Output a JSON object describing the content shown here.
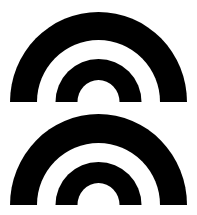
{
  "figures": [
    {
      "name": "top-concentric-semicircles",
      "center_x": 98.5,
      "baseline_y": 102,
      "bands": [
        {
          "rx": 88.5,
          "ry": 90,
          "color": "#000000"
        },
        {
          "rx": 61.5,
          "ry": 62,
          "color": "#ffffff"
        },
        {
          "rx": 43,
          "ry": 43,
          "color": "#000000"
        },
        {
          "rx": 21,
          "ry": 22,
          "color": "#ffffff"
        }
      ]
    },
    {
      "name": "bottom-concentric-semicircles",
      "center_x": 98.5,
      "baseline_y": 205,
      "bands": [
        {
          "rx": 88.5,
          "ry": 91,
          "color": "#000000"
        },
        {
          "rx": 61.5,
          "ry": 62,
          "color": "#ffffff"
        },
        {
          "rx": 43,
          "ry": 43,
          "color": "#000000"
        },
        {
          "rx": 21,
          "ry": 22,
          "color": "#ffffff"
        }
      ]
    }
  ],
  "colors": {
    "background": "#ffffff",
    "foreground": "#000000"
  }
}
